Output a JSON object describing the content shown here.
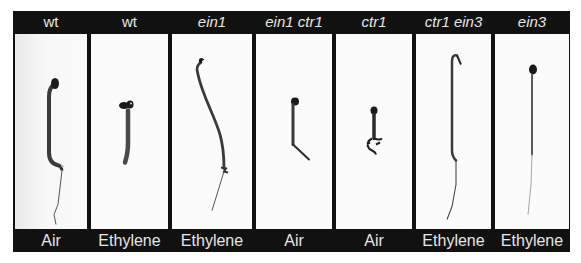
{
  "figure": {
    "frame_color": "#111111",
    "label_color": "#e6e6e6",
    "panels": [
      {
        "genotype": "wt",
        "condition": "Air",
        "genotype_italic": false
      },
      {
        "genotype": "wt",
        "condition": "Ethylene",
        "genotype_italic": false
      },
      {
        "genotype": "ein1",
        "condition": "Ethylene",
        "genotype_italic": true
      },
      {
        "genotype": "ein1  ctr1",
        "condition": "Air",
        "genotype_italic": true
      },
      {
        "genotype": "ctr1",
        "condition": "Air",
        "genotype_italic": true
      },
      {
        "genotype": "ctr1 ein3",
        "condition": "Ethylene",
        "genotype_italic": true
      },
      {
        "genotype": "ein3",
        "condition": "Ethylene",
        "genotype_italic": true
      }
    ]
  }
}
